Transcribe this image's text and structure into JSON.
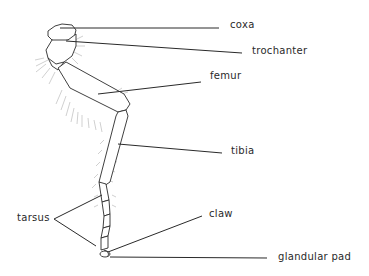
{
  "diagram": {
    "labels": {
      "coxa": "coxa",
      "trochanter": "trochanter",
      "femur": "femur",
      "tibia": "tibia",
      "tarsus": "tarsus",
      "claw": "claw",
      "glandular_pad": "glandular pad"
    },
    "colors": {
      "ink": "#2a2a2a",
      "hair": "#9a9a9a",
      "background": "#ffffff"
    }
  }
}
